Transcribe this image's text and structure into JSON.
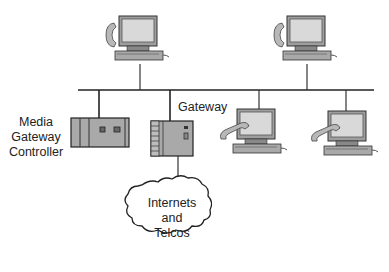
{
  "diagram": {
    "type": "network-topology",
    "labels": {
      "media_gateway_controller": [
        "Media",
        "Gateway",
        "Controller"
      ],
      "gateway": "Gateway",
      "cloud": [
        "Internets",
        "and",
        "Telcos"
      ]
    },
    "nodes": [
      {
        "id": "pc-top-left",
        "kind": "computer-with-phone"
      },
      {
        "id": "pc-top-right",
        "kind": "computer-with-phone"
      },
      {
        "id": "pc-bottom-mid",
        "kind": "computer-with-phone"
      },
      {
        "id": "pc-bottom-right",
        "kind": "computer-with-phone"
      },
      {
        "id": "media-gateway-controller",
        "kind": "server-box"
      },
      {
        "id": "gateway",
        "kind": "server-box"
      },
      {
        "id": "cloud",
        "kind": "cloud"
      }
    ],
    "edges": [
      [
        "bus",
        "pc-top-left"
      ],
      [
        "bus",
        "pc-top-right"
      ],
      [
        "bus",
        "pc-bottom-mid"
      ],
      [
        "bus",
        "pc-bottom-right"
      ],
      [
        "bus",
        "media-gateway-controller"
      ],
      [
        "bus",
        "gateway"
      ],
      [
        "gateway",
        "cloud"
      ]
    ],
    "colors": {
      "line": "#222222",
      "device_fill": "#a9a9a9",
      "screen": "#d9d9d9"
    }
  }
}
